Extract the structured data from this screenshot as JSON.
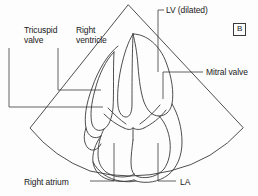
{
  "figure": {
    "type": "apical-four-chamber-echocardiogram-line-drawing",
    "panel_letter": "B",
    "stroke_color": "#3a3a3a",
    "background_color": "#fdfdfd",
    "text_color": "#1a1a1a"
  },
  "labels": {
    "tricuspid_valve": "Tricuspid\nvalve",
    "right_ventricle": "Right\nventricle",
    "lv_dilated": "LV (dilated)",
    "mitral_valve": "Mitral valve",
    "right_atrium": "Right atrium",
    "la": "LA"
  },
  "annotations": [
    {
      "name": "tricuspid-valve",
      "text": "Tricuspid valve",
      "side": "left"
    },
    {
      "name": "right-ventricle",
      "text": "Right ventricle",
      "side": "left"
    },
    {
      "name": "lv-dilated",
      "text": "LV (dilated)",
      "side": "top-right"
    },
    {
      "name": "mitral-valve",
      "text": "Mitral valve",
      "side": "right"
    },
    {
      "name": "right-atrium",
      "text": "Right atrium",
      "side": "bottom-left"
    },
    {
      "name": "la",
      "text": "LA",
      "side": "bottom-right"
    }
  ]
}
